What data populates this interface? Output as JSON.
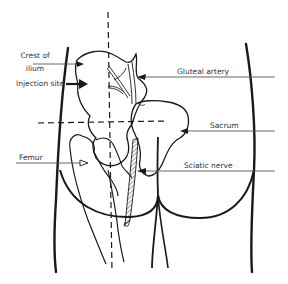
{
  "diagram": {
    "labels": {
      "crest_of_ilium_line1": "Crest of",
      "crest_of_ilium_line2": "ilium",
      "injection_site": "Injection site",
      "femur": "Femur",
      "gluteal_artery": "Gluteal artery",
      "sacrum": "Sacrum",
      "sciatic_nerve": "Sciatic nerve"
    },
    "colors": {
      "line": "#1a1a1a",
      "leader": "#555555",
      "text": "#333333",
      "background": "#ffffff"
    }
  }
}
